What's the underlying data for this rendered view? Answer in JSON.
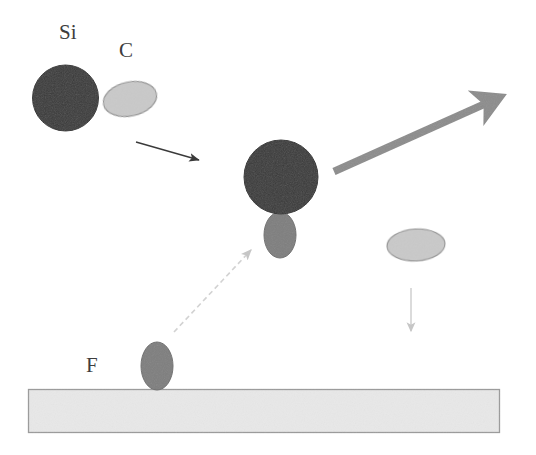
{
  "figure": {
    "background_color": "#ffffff",
    "width": 536,
    "height": 455
  },
  "labels": {
    "si": "Si",
    "c": "C",
    "f": "F"
  },
  "colors": {
    "si_atom": "#3a3a3a",
    "c_atom": "#c9c9c9",
    "f_atom": "#7e7e7e",
    "substrate_fill": "#e8e8e8",
    "substrate_stroke": "#9a9a9a",
    "thick_arrow": "#8c8c8c",
    "thin_arrow": "#3a3a3a",
    "faint_arrow": "#d2d2d2",
    "label_text": "#3d3d3d",
    "atom_outline": "#8f8f8f"
  },
  "objects": {
    "si_atom_left": {
      "name": "Si atom (incoming molecule)",
      "shape": "circle",
      "cx": 65.5,
      "cy": 98,
      "r": 33
    },
    "c_atom_left": {
      "name": "C atom (bonded to Si)",
      "shape": "ellipse",
      "cx": 130,
      "cy": 99,
      "rx": 27,
      "ry": 17,
      "rotation": -12
    },
    "si_atom_middle": {
      "name": "Si atom (reacting)",
      "shape": "circle",
      "cx": 281,
      "cy": 177,
      "r": 37
    },
    "f_atom_bonded": {
      "name": "F atom bonded to Si",
      "shape": "ellipse",
      "cx": 280,
      "cy": 235,
      "rx": 16,
      "ry": 23,
      "rotation": 0
    },
    "c_atom_released": {
      "name": "C atom released",
      "shape": "ellipse",
      "cx": 416,
      "cy": 245,
      "rx": 29,
      "ry": 16,
      "rotation": -3
    },
    "f_atom_surface": {
      "name": "F atom on substrate",
      "shape": "ellipse",
      "cx": 157,
      "cy": 366,
      "rx": 16,
      "ry": 24,
      "rotation": 0
    },
    "substrate": {
      "name": "substrate slab",
      "shape": "rect",
      "x": 28,
      "y": 389,
      "width": 472,
      "height": 44
    }
  },
  "arrows": {
    "incoming_trajectory": {
      "name": "incoming molecule trajectory",
      "style": "thin solid",
      "x1": 136,
      "y1": 142,
      "x2": 203,
      "y2": 161
    },
    "outgoing_product": {
      "name": "outgoing product trajectory",
      "style": "thick solid",
      "x1": 334,
      "y1": 171,
      "x2": 505,
      "y2": 95
    },
    "f_uptake": {
      "name": "F atom uptake from surface",
      "style": "dashed faint",
      "x1": 174,
      "y1": 332,
      "x2": 254,
      "y2": 247
    },
    "c_deposition": {
      "name": "C atom deposition to surface",
      "style": "thin faint vertical",
      "x1": 411,
      "y1": 288,
      "x2": 411,
      "y2": 338
    }
  }
}
